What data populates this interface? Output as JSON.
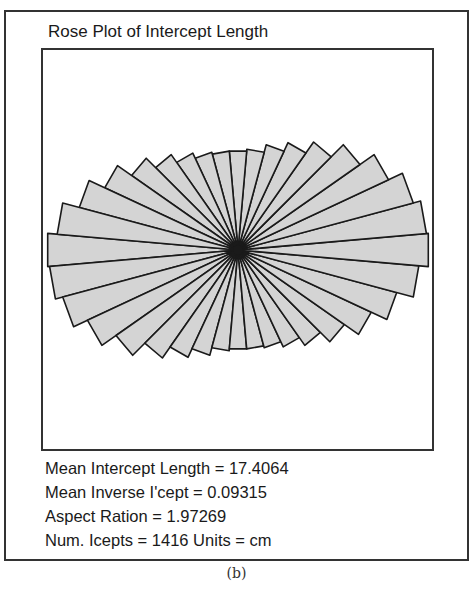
{
  "title": "Rose Plot of Intercept Length",
  "stats": {
    "mean_intercept_length": "Mean Intercept Length = 17.4064",
    "mean_inverse_intercept": "Mean Inverse I'cept = 0.09315",
    "aspect_ratio": "Aspect Ration = 1.97269",
    "num_intercepts": "Num. Icepts = 1416 Units = cm"
  },
  "caption": "(b)",
  "colors": {
    "fill": "#d4d4d4",
    "stroke": "#1a1a1a",
    "frame": "#333333"
  },
  "chart_data": {
    "type": "rose",
    "title": "Rose Plot of Intercept Length",
    "sector_count": 36,
    "sector_width_deg": 10,
    "spoke_angles_deg_start": 5,
    "center_px": [
      197,
      202
    ],
    "radius_major_px": 191,
    "radius_minor_px": 100,
    "radii_relative": [
      1.0,
      0.99,
      0.95,
      0.87,
      0.78,
      0.69,
      0.62,
      0.57,
      0.53,
      0.52,
      0.52,
      0.53,
      0.56,
      0.61,
      0.68,
      0.77,
      0.86,
      0.95,
      1.0,
      0.99,
      0.95,
      0.87,
      0.78,
      0.69,
      0.62,
      0.57,
      0.53,
      0.52,
      0.52,
      0.53,
      0.56,
      0.61,
      0.68,
      0.77,
      0.86,
      0.95
    ],
    "annotations": [
      "Mean Intercept Length = 17.4064",
      "Mean Inverse I'cept = 0.09315",
      "Aspect Ration = 1.97269",
      "Num. Icepts = 1416 Units = cm"
    ],
    "units": "cm"
  }
}
